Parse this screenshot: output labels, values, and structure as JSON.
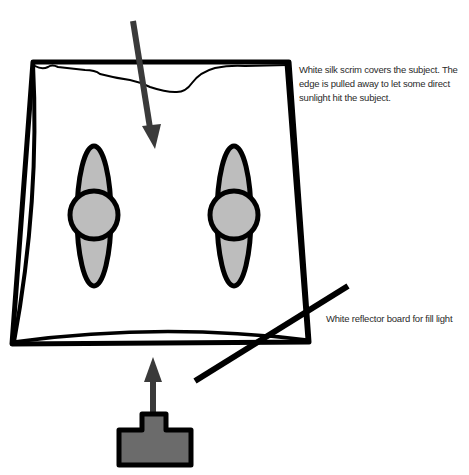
{
  "diagram": {
    "type": "lighting-setup",
    "labels": {
      "scrim": "White silk scrim covers the subject. The edge is pulled away to let some direct sunlight hit the subject.",
      "reflector": "White reflector board for fill light"
    },
    "elements": [
      {
        "id": "sunlight-arrow",
        "kind": "arrow",
        "direction": "down"
      },
      {
        "id": "silk-scrim",
        "kind": "frame"
      },
      {
        "id": "subject-left",
        "kind": "person-top-view"
      },
      {
        "id": "subject-right",
        "kind": "person-top-view"
      },
      {
        "id": "reflector-board",
        "kind": "line"
      },
      {
        "id": "camera-arrow",
        "kind": "arrow",
        "direction": "up"
      },
      {
        "id": "camera",
        "kind": "camera-icon"
      }
    ],
    "colors": {
      "stroke": "#000000",
      "subject_fill": "#bdbdbd",
      "camera_fill": "#6b6b6b",
      "arrow_fill": "#3a3a3a",
      "text": "#2a2a2a"
    }
  }
}
